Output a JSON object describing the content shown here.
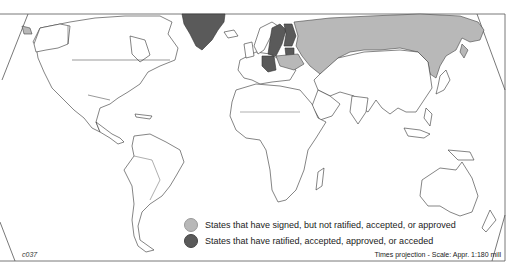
{
  "map": {
    "title": "",
    "projection_note": "Times projection - Scale: Appr. 1:180 mill",
    "map_code": "c037",
    "colors": {
      "signed": "#b8b8b8",
      "ratified": "#5a5a5a",
      "other": "#ffffff",
      "outline": "#333333"
    },
    "legend": [
      {
        "key": "signed",
        "label": "States that have signed, but not ratified, accepted, or approved",
        "color": "#b8b8b8"
      },
      {
        "key": "ratified",
        "label": "States that have ratified, accepted, approved, or acceded",
        "color": "#5a5a5a"
      }
    ],
    "shaded_regions": {
      "ratified": [
        "Greenland",
        "Sweden",
        "Finland",
        "Germany",
        "Baltic states"
      ],
      "signed": [
        "Russia",
        "Belarus/Ukraine region"
      ]
    }
  }
}
